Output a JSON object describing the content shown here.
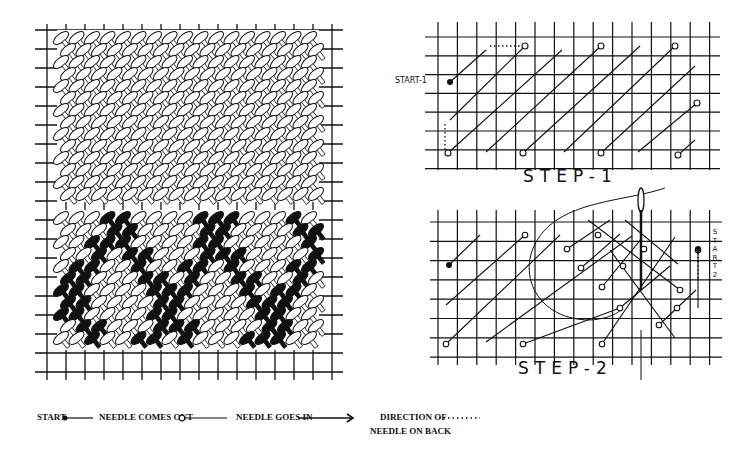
{
  "figure": {
    "left_panel": {
      "description": "Completed basketweave stitch sample: upper block in white yarn, lower block with black diagonal bands forming a chevron/X pattern"
    },
    "step1": {
      "caption": "STEP-1",
      "start_label": "START-1"
    },
    "step2": {
      "caption": "STEP-2",
      "start_label_letters": [
        "S",
        "T",
        "A",
        "R",
        "T",
        "2"
      ]
    }
  },
  "legend": {
    "items": [
      {
        "label": "START",
        "symbol": "filled-dot-line-icon"
      },
      {
        "label": "NEEDLE COMES OUT",
        "symbol": "open-circle-line-icon"
      },
      {
        "label": "NEEDLE GOES IN",
        "symbol": "arrow-line-icon"
      },
      {
        "label_line1": "DIRECTION OF",
        "label_line2": "NEEDLE ON BACK",
        "symbol": "dotted-line-icon"
      }
    ]
  },
  "colors": {
    "ink": "#111111",
    "paper": "#ffffff"
  }
}
